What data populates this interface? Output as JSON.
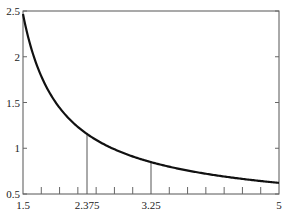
{
  "chart_data": {
    "type": "line",
    "title": "",
    "xlabel": "",
    "ylabel": "",
    "function": "y = 1/ln(x)",
    "xlim": [
      1.5,
      5
    ],
    "ylim": [
      0.5,
      2.5
    ],
    "grid": false,
    "legend": null,
    "x_tick_labels": [
      "1.5",
      "2.375",
      "3.25",
      "5"
    ],
    "y_tick_labels": [
      "0.5",
      "1",
      "1.5",
      "2",
      "2.5"
    ],
    "series": [
      {
        "name": "curve",
        "x": [
          1.5,
          1.75,
          2.0,
          2.375,
          2.75,
          3.25,
          3.75,
          4.25,
          5.0
        ],
        "y": [
          2.47,
          1.79,
          1.44,
          1.16,
          0.99,
          0.85,
          0.76,
          0.69,
          0.62
        ]
      }
    ],
    "annotations": [
      {
        "type": "vertical-line",
        "x": 2.375,
        "to_y": 1.16
      },
      {
        "type": "vertical-line",
        "x": 3.25,
        "to_y": 0.85
      }
    ]
  },
  "axes": {
    "x_ticks": [
      {
        "value": 1.5,
        "label": "1.5"
      },
      {
        "value": 2.375,
        "label": "2.375"
      },
      {
        "value": 3.25,
        "label": "3.25"
      },
      {
        "value": 5,
        "label": "5"
      }
    ],
    "y_ticks": [
      {
        "value": 0.5,
        "label": "0.5"
      },
      {
        "value": 1,
        "label": "1"
      },
      {
        "value": 1.5,
        "label": "1.5"
      },
      {
        "value": 2,
        "label": "2"
      },
      {
        "value": 2.5,
        "label": "2.5"
      }
    ]
  }
}
